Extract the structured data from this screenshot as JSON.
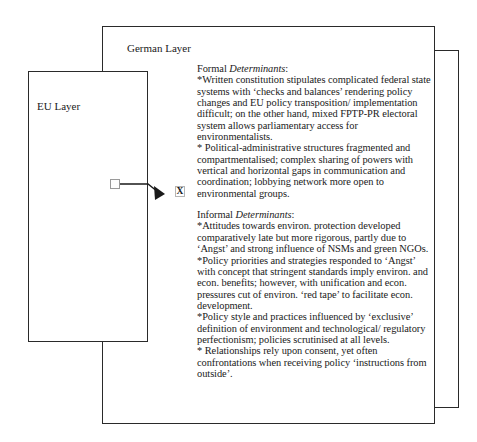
{
  "diagram": {
    "layers": {
      "back": {
        "label": ""
      },
      "german": {
        "label": "German Layer"
      },
      "eu": {
        "label": "EU Layer"
      }
    },
    "connector": {
      "marker_label": "X",
      "line_color": "#1a1a1a"
    },
    "formal": {
      "heading_prefix": "Formal ",
      "heading_italic": "Determinants",
      "heading_suffix": ":",
      "items": [
        "*Written constitution stipulates complicated federal state systems with ‘checks and balances’ rendering policy changes and EU policy transposition/ implementation difficult; on the other hand, mixed FPTP-PR electoral system allows parliamentary access for environmentalists.",
        "* Political-administrative structures fragmented and compartmentalised; complex sharing of powers with vertical and horizontal gaps in communication and coordination; lobbying network more open to environmental groups."
      ]
    },
    "informal": {
      "heading_prefix": "Informal ",
      "heading_italic": "Determinants",
      "heading_suffix": ":",
      "items": [
        "*Attitudes towards environ. protection developed comparatively late but more rigorous, partly due to ‘Angst’ and strong influence of NSMs and green NGOs.",
        "*Policy priorities and strategies responded to ‘Angst’ with concept that stringent standards imply environ. and econ. benefits; however, with unification and econ. pressures cut of environ. ‘red tape’ to facilitate econ. development.",
        "*Policy style and practices influenced by ‘exclusive’ definition of environment and technological/ regulatory perfectionism; policies scrutinised at all levels.",
        "*  Relationships rely upon consent, yet often confrontations when receiving policy ‘instructions from outside’."
      ]
    }
  }
}
